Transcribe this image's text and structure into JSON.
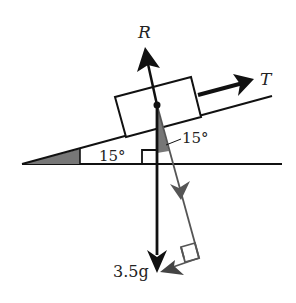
{
  "diagram": {
    "type": "force-diagram-inclined-plane",
    "labels": {
      "normal_reaction": "R",
      "tension": "T",
      "weight": "3.5g",
      "incline_angle": "15°",
      "component_angle": "15°"
    },
    "colors": {
      "primary": "#111111",
      "component": "#555555",
      "shade": "#777777",
      "background": "#ffffff"
    }
  }
}
